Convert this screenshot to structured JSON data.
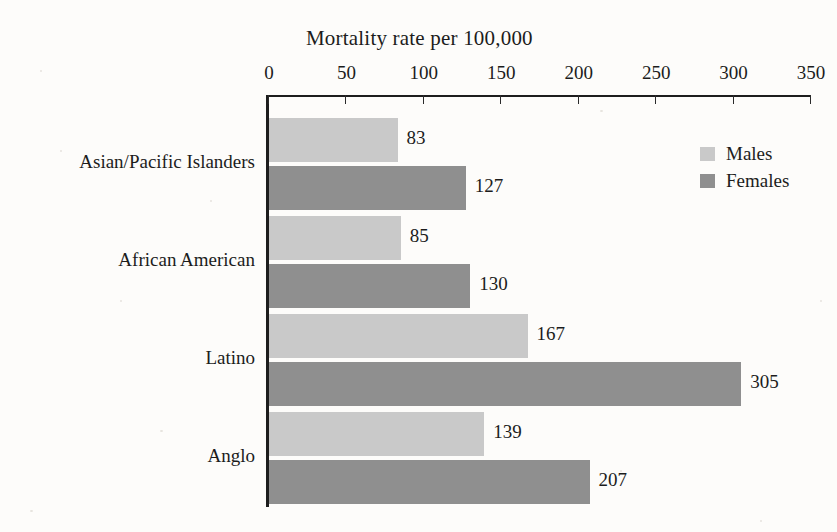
{
  "chart_data": {
    "type": "bar",
    "orientation": "horizontal",
    "title": "Mortality rate per 100,000",
    "xlabel": "",
    "ylabel": "",
    "xlim": [
      0,
      350
    ],
    "xticks": [
      0,
      50,
      100,
      150,
      200,
      250,
      300,
      350
    ],
    "grid": false,
    "legend_position": "right",
    "categories": [
      "Asian/Pacific Islanders",
      "African American",
      "Latino",
      "Anglo"
    ],
    "series": [
      {
        "name": "Males",
        "color": "#c9c9c9",
        "values": [
          83,
          85,
          167,
          139
        ]
      },
      {
        "name": "Females",
        "color": "#8f8f8f",
        "values": [
          127,
          130,
          305,
          207
        ]
      }
    ]
  },
  "axis": {
    "tick_labels": [
      "0",
      "50",
      "100",
      "150",
      "200",
      "250",
      "300",
      "350"
    ]
  },
  "legend": {
    "items": [
      {
        "label": "Males",
        "swatch": "males"
      },
      {
        "label": "Females",
        "swatch": "females"
      }
    ]
  }
}
